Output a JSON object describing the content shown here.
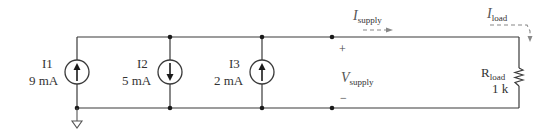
{
  "diagram": {
    "type": "circuit-schematic",
    "sources": [
      {
        "name": "I1",
        "value": "9 mA",
        "direction": "up"
      },
      {
        "name": "I2",
        "value": "5 mA",
        "direction": "down"
      },
      {
        "name": "I3",
        "value": "2 mA",
        "direction": "up"
      }
    ],
    "supply": {
      "voltage_symbol": "V",
      "voltage_sub": "supply",
      "plus": "+",
      "minus": "−",
      "current_symbol": "I",
      "current_sub": "supply"
    },
    "load": {
      "name": "R",
      "name_sub": "load",
      "value": "1 k",
      "current_symbol": "I",
      "current_sub": "load"
    }
  }
}
